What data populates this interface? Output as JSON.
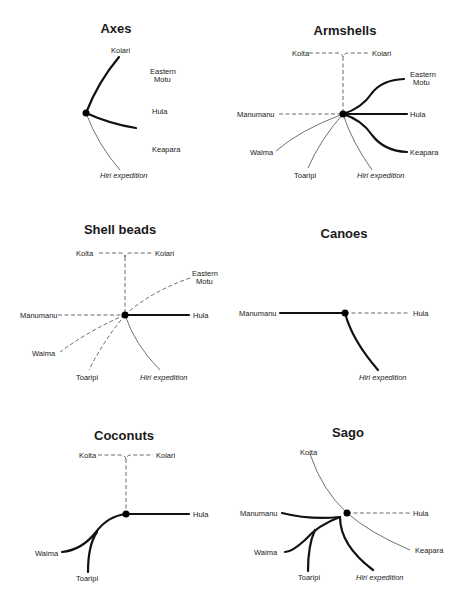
{
  "figure": {
    "legend_line_styles": {
      "thick": "thick solid line",
      "thin": "thin solid line",
      "dash": "dashed line"
    },
    "panels": [
      {
        "title": "Axes",
        "labels": [
          "Koiari",
          "Eastern",
          "Motu",
          "Hula",
          "Keapara",
          "Hiri expedition"
        ],
        "links": [
          {
            "to": "Koiari",
            "style": "thick"
          },
          {
            "to": "Hula",
            "style": "thick"
          },
          {
            "to": "Hiri expedition",
            "style": "thin"
          }
        ]
      },
      {
        "title": "Armshells",
        "labels": [
          "Koita",
          "Koiari",
          "Eastern",
          "Motu",
          "Manumanu",
          "Hula",
          "Waima",
          "Keapara",
          "Toaripi",
          "Hiri expedition"
        ],
        "links": [
          {
            "to": "Koita/Koiari",
            "style": "dash"
          },
          {
            "to": "Eastern Motu",
            "style": "thick"
          },
          {
            "to": "Hula",
            "style": "thick"
          },
          {
            "to": "Keapara",
            "style": "thick"
          },
          {
            "to": "Manumanu",
            "style": "dash"
          },
          {
            "to": "Waima",
            "style": "thin"
          },
          {
            "to": "Toaripi",
            "style": "thin"
          },
          {
            "to": "Hiri expedition",
            "style": "thin"
          }
        ]
      },
      {
        "title": "Shell beads",
        "labels": [
          "Koita",
          "Koiari",
          "Eastern",
          "Motu",
          "Manumanu",
          "Hula",
          "Waima",
          "Toaripi",
          "Hiri expedition"
        ],
        "links": [
          {
            "to": "Koita/Koiari",
            "style": "dash"
          },
          {
            "to": "Eastern Motu",
            "style": "dash"
          },
          {
            "to": "Hula",
            "style": "thick"
          },
          {
            "to": "Manumanu",
            "style": "dash"
          },
          {
            "to": "Waima",
            "style": "dash"
          },
          {
            "to": "Toaripi",
            "style": "dash"
          },
          {
            "to": "Hiri expedition",
            "style": "thin"
          }
        ]
      },
      {
        "title": "Canoes",
        "labels": [
          "Manumanu",
          "Hula",
          "Hiri expedition"
        ],
        "links": [
          {
            "to": "Manumanu",
            "style": "thick"
          },
          {
            "to": "Hula",
            "style": "dash"
          },
          {
            "to": "Hiri expedition",
            "style": "thick"
          }
        ]
      },
      {
        "title": "Coconuts",
        "labels": [
          "Koita",
          "Koiari",
          "Hula",
          "Waima",
          "Toaripi"
        ],
        "links": [
          {
            "to": "Koita/Koiari",
            "style": "dash"
          },
          {
            "to": "Hula",
            "style": "thick"
          },
          {
            "to": "Waima",
            "style": "thick"
          },
          {
            "to": "Toaripi",
            "style": "thick"
          }
        ]
      },
      {
        "title": "Sago",
        "labels": [
          "Koita",
          "Manumanu",
          "Hula",
          "Waima",
          "Keapara",
          "Toaripi",
          "Hiri expedition"
        ],
        "links": [
          {
            "to": "Koita",
            "style": "thin"
          },
          {
            "to": "Keapara",
            "style": "thin"
          },
          {
            "to": "Hula",
            "style": "dash"
          },
          {
            "to": "Manumanu",
            "style": "thick"
          },
          {
            "to": "Waima",
            "style": "thick"
          },
          {
            "to": "Toaripi",
            "style": "thick"
          },
          {
            "to": "Hiri expedition",
            "style": "thick"
          }
        ]
      }
    ]
  }
}
